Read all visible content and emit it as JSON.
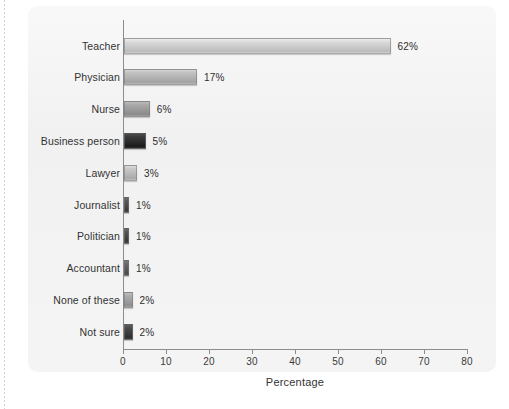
{
  "chart_data": {
    "type": "bar",
    "orientation": "horizontal",
    "title": "",
    "xlabel": "Percentage",
    "ylabel": "",
    "xlim": [
      0,
      80
    ],
    "xticks": [
      0,
      10,
      20,
      30,
      40,
      50,
      60,
      70,
      80
    ],
    "xtick_labels": [
      "0",
      "10",
      "20",
      "30",
      "40",
      "50",
      "60",
      "70",
      "80"
    ],
    "grid": false,
    "legend": false,
    "categories": [
      "Teacher",
      "Physician",
      "Nurse",
      "Business person",
      "Lawyer",
      "Journalist",
      "Politician",
      "Accountant",
      "None of these",
      "Not sure"
    ],
    "values": [
      62,
      17,
      6,
      5,
      3,
      1,
      1,
      1,
      2,
      2
    ],
    "value_labels": [
      "62%",
      "17%",
      "6%",
      "5%",
      "3%",
      "1%",
      "1%",
      "1%",
      "2%",
      "2%"
    ],
    "bar_colors": [
      "#cbcbcb",
      "#b2b2b2",
      "#9a9a9a",
      "#2b2b2b",
      "#b9b9b9",
      "#4a4a4a",
      "#474747",
      "#5a5a5a",
      "#9e9e9e",
      "#3d3d3d"
    ]
  },
  "panel": {
    "background_color": "#f1f1f1",
    "axis_color": "#8d8d8d",
    "text_color": "#333333"
  }
}
